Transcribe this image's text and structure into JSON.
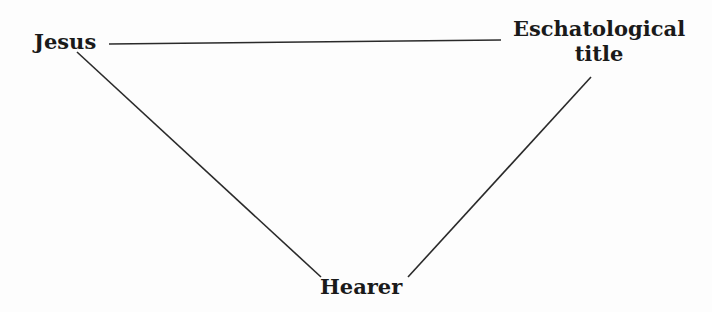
{
  "diagram": {
    "type": "triangle-relationship",
    "nodes": [
      {
        "id": "jesus",
        "label": "Jesus"
      },
      {
        "id": "title",
        "label_line1": "Eschatological",
        "label_line2": "title"
      },
      {
        "id": "hearer",
        "label": "Hearer"
      }
    ],
    "edges": [
      {
        "from": "jesus",
        "to": "title"
      },
      {
        "from": "jesus",
        "to": "hearer"
      },
      {
        "from": "title",
        "to": "hearer"
      }
    ],
    "colors": {
      "line": "#2a2a2a",
      "text": "#1a1a1a",
      "background": "#fdfdfd"
    }
  }
}
